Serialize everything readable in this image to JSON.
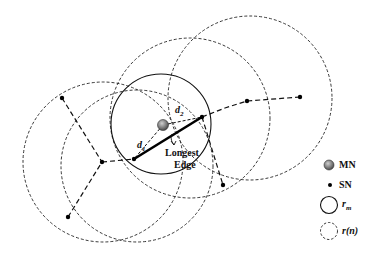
{
  "diagram": {
    "type": "network-coverage",
    "mobile_node": {
      "label": "MN",
      "x": 163,
      "y": 125,
      "color": "#777777"
    },
    "sensor_nodes": [
      {
        "id": "sn1",
        "x": 134,
        "y": 159
      },
      {
        "id": "sn2",
        "x": 202,
        "y": 117
      },
      {
        "id": "sn3",
        "x": 102,
        "y": 162
      },
      {
        "id": "sn4",
        "x": 62,
        "y": 98
      },
      {
        "id": "sn5",
        "x": 68,
        "y": 217
      },
      {
        "id": "sn6",
        "x": 223,
        "y": 185
      },
      {
        "id": "sn7",
        "x": 247,
        "y": 101
      },
      {
        "id": "sn8",
        "x": 300,
        "y": 97
      }
    ],
    "longest_edge": {
      "from": "sn1",
      "to": "sn2",
      "label_line1": "Longest",
      "label_line2": "Edge"
    },
    "distance_labels": {
      "d1": "d",
      "d1_sub": "1",
      "d2": "d",
      "d2_sub": "2"
    },
    "mn_circle": {
      "cx": 161,
      "cy": 124,
      "r": 50
    },
    "sn_circles": [
      {
        "cx": 103,
        "cy": 162,
        "r": 80
      },
      {
        "cx": 137,
        "cy": 166,
        "r": 76
      },
      {
        "cx": 190,
        "cy": 118,
        "r": 80
      },
      {
        "cx": 250,
        "cy": 98,
        "r": 82
      }
    ]
  },
  "legend": {
    "items": [
      {
        "symbol": "mn-dot",
        "label": "MN"
      },
      {
        "symbol": "sn-dot",
        "label": "SN"
      },
      {
        "symbol": "solid-circle",
        "label": "r",
        "sub": "m"
      },
      {
        "symbol": "dashed-circle",
        "label": "r(n)"
      }
    ]
  }
}
